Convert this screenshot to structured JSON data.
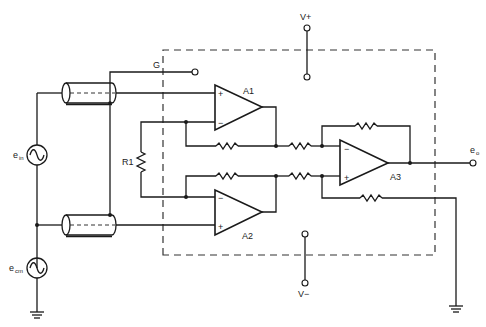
{
  "diagram": {
    "type": "circuit-schematic",
    "colors": {
      "ink": "#1a1a1a",
      "background": "#ffffff"
    },
    "labels": {
      "guard": "G",
      "v_plus": "V+",
      "v_minus": "V−",
      "r1": "R1",
      "a1": "A1",
      "a2": "A2",
      "a3": "A3",
      "e_in_main": "e",
      "e_in_sub": "in",
      "e_cm_main": "e",
      "e_cm_sub": "cm",
      "e_out_main": "e",
      "e_out_sub": "o",
      "plus": "+",
      "minus": "−"
    },
    "components": [
      {
        "id": "A1",
        "kind": "op-amp",
        "inputs": [
          "+",
          "−"
        ]
      },
      {
        "id": "A2",
        "kind": "op-amp",
        "inputs": [
          "−",
          "+"
        ]
      },
      {
        "id": "A3",
        "kind": "op-amp",
        "inputs": [
          "−",
          "+"
        ]
      },
      {
        "id": "R1",
        "kind": "resistor"
      },
      {
        "id": "e_in",
        "kind": "ac-source"
      },
      {
        "id": "e_cm",
        "kind": "ac-source"
      },
      {
        "id": "cable-upper",
        "kind": "shielded-cable"
      },
      {
        "id": "cable-lower",
        "kind": "shielded-cable"
      }
    ],
    "caption": ""
  }
}
